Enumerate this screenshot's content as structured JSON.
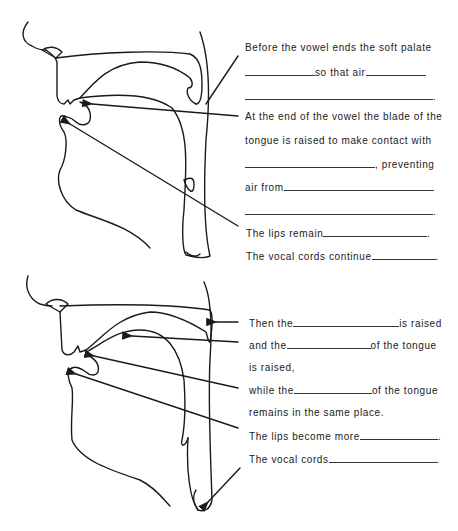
{
  "panel_top": {
    "lines": [
      {
        "parts": [
          "Before the vowel ends the soft palate"
        ]
      },
      {
        "parts": [
          "",
          "so that air",
          ""
        ],
        "blanks": [
          88,
          70
        ]
      },
      {
        "parts": [
          "",
          "."
        ],
        "blanks": [
          188
        ]
      },
      {
        "parts": [
          "At the end of the vowel the blade of the"
        ]
      },
      {
        "parts": [
          "tongue is raised to make contact with"
        ]
      },
      {
        "parts": [
          "",
          ", preventing"
        ],
        "blanks": [
          130
        ]
      },
      {
        "parts": [
          "air from",
          ""
        ],
        "blanks": [
          150
        ]
      },
      {
        "parts": [
          "",
          "."
        ],
        "blanks": [
          188
        ]
      },
      {
        "parts": [
          "The lips remain",
          "."
        ],
        "blanks": [
          104
        ]
      },
      {
        "parts": [
          "The vocal cords continue",
          "."
        ],
        "blanks": [
          64
        ]
      }
    ]
  },
  "panel_bottom": {
    "lines": [
      {
        "parts": [
          "Then the",
          "is raised"
        ],
        "blanks": [
          106
        ]
      },
      {
        "parts": [
          "and the",
          "of the tongue"
        ],
        "blanks": [
          84
        ]
      },
      {
        "parts": [
          "is raised,"
        ]
      },
      {
        "parts": [
          "while the",
          "of the tongue"
        ],
        "blanks": [
          78
        ]
      },
      {
        "parts": [
          "remains in the same place."
        ]
      },
      {
        "parts": [
          "The lips become more",
          "."
        ],
        "blanks": [
          78
        ]
      },
      {
        "parts": [
          "The vocal cords",
          "."
        ],
        "blanks": [
          108
        ]
      }
    ]
  },
  "text": {
    "t0": "Before the vowel ends the soft palate",
    "t1a": "so that air",
    "t3": "At the end of the vowel the blade of the",
    "t4": "tongue is raised to make contact with",
    "t5": ", preventing",
    "t6": "air from",
    "t8": "The lips remain",
    "t9": "The vocal cords continue",
    "b0a": "Then the",
    "b0b": "is raised",
    "b1a": "and the",
    "b1b": "of the tongue",
    "b2": "is raised,",
    "b3a": "while the",
    "b3b": "of the tongue",
    "b4": "remains in the same place.",
    "b5": "The lips become more",
    "b6": "The vocal cords",
    "dot": "."
  },
  "colors": {
    "ink": "#1a1a1a",
    "paper": "#ffffff"
  }
}
